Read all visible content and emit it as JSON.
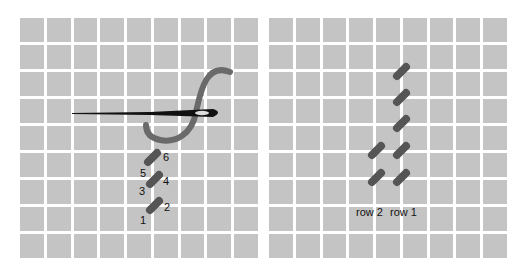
{
  "diagram": {
    "left_panel": {
      "name": "stitch-sequence",
      "stitch_numbers": [
        "1",
        "2",
        "3",
        "4",
        "5",
        "6"
      ]
    },
    "right_panel": {
      "name": "row-layout",
      "row_labels": [
        "row 2",
        "row 1"
      ]
    },
    "grid": {
      "columns": 9,
      "rows": 9,
      "cell_color": "#c4c4c4",
      "gap_color": "#ffffff"
    },
    "colors": {
      "stitch": "#555555",
      "thread": "#666666",
      "needle": "#111111"
    }
  }
}
